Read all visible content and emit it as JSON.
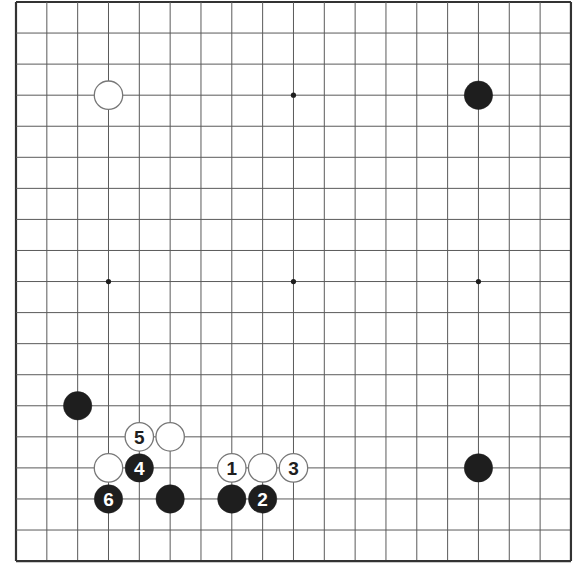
{
  "board": {
    "size": 19,
    "origin_x": 16,
    "origin_y": 2,
    "cell_w": 30.83,
    "cell_h": 31.06,
    "border_color": "#333333",
    "line_color": "#5a5a5a",
    "background": "#ffffff",
    "star_points": [
      [
        3,
        3
      ],
      [
        9,
        3
      ],
      [
        15,
        3
      ],
      [
        3,
        9
      ],
      [
        9,
        9
      ],
      [
        15,
        9
      ],
      [
        3,
        15
      ],
      [
        9,
        15
      ],
      [
        15,
        15
      ]
    ]
  },
  "stones": [
    {
      "color": "white",
      "col": 3,
      "row": 3,
      "label": ""
    },
    {
      "color": "black",
      "col": 15,
      "row": 3,
      "label": ""
    },
    {
      "color": "black",
      "col": 2,
      "row": 13,
      "label": ""
    },
    {
      "color": "white",
      "col": 4,
      "row": 14,
      "label": "5"
    },
    {
      "color": "white",
      "col": 5,
      "row": 14,
      "label": ""
    },
    {
      "color": "white",
      "col": 3,
      "row": 15,
      "label": ""
    },
    {
      "color": "black",
      "col": 4,
      "row": 15,
      "label": "4"
    },
    {
      "color": "white",
      "col": 7,
      "row": 15,
      "label": "1"
    },
    {
      "color": "white",
      "col": 8,
      "row": 15,
      "label": ""
    },
    {
      "color": "white",
      "col": 9,
      "row": 15,
      "label": "3"
    },
    {
      "color": "black",
      "col": 15,
      "row": 15,
      "label": ""
    },
    {
      "color": "black",
      "col": 3,
      "row": 16,
      "label": "6"
    },
    {
      "color": "black",
      "col": 5,
      "row": 16,
      "label": ""
    },
    {
      "color": "black",
      "col": 7,
      "row": 16,
      "label": ""
    },
    {
      "color": "black",
      "col": 8,
      "row": 16,
      "label": "2"
    }
  ],
  "colors": {
    "black_stone": "#1e1e1e",
    "white_stone": "#ffffff",
    "white_outline": "#777777",
    "label_on_black": "#ffffff",
    "label_on_white": "#1e1e1e"
  }
}
